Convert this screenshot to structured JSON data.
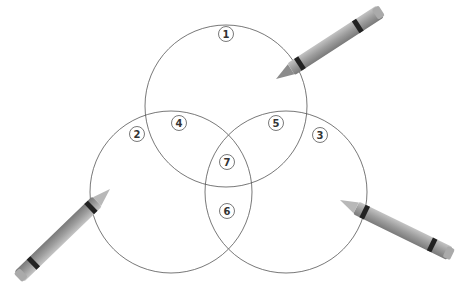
{
  "diagram": {
    "type": "venn-3",
    "circles": [
      {
        "name": "top",
        "cx": 226,
        "cy": 106,
        "r": 81
      },
      {
        "name": "left",
        "cx": 171,
        "cy": 192,
        "r": 81
      },
      {
        "name": "right",
        "cx": 286,
        "cy": 192,
        "r": 81
      }
    ],
    "regions": [
      {
        "label": "1",
        "x": 226,
        "y": 34
      },
      {
        "label": "2",
        "x": 137,
        "y": 134
      },
      {
        "label": "3",
        "x": 320,
        "y": 135
      },
      {
        "label": "4",
        "x": 179,
        "y": 123
      },
      {
        "label": "5",
        "x": 276,
        "y": 123
      },
      {
        "label": "6",
        "x": 227,
        "y": 211
      },
      {
        "label": "7",
        "x": 227,
        "y": 162
      }
    ],
    "crayons": [
      {
        "name": "crayon-top-right",
        "tipX": 276,
        "tipY": 79,
        "angle": -33,
        "length": 170
      },
      {
        "name": "crayon-bottom-left",
        "tipX": 110,
        "tipY": 189,
        "angle": 136,
        "length": 140
      },
      {
        "name": "crayon-bottom-right",
        "tipX": 340,
        "tipY": 200,
        "angle": 26,
        "length": 130
      }
    ],
    "colors": {
      "stroke": "#555555",
      "crayon": "#9a9a9a",
      "band": "#222222"
    }
  }
}
